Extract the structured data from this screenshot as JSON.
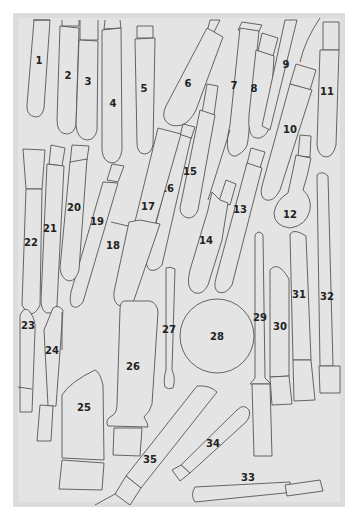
{
  "diagram": {
    "type": "numbered-shape-template",
    "colors": {
      "background": "#ffffff",
      "frame": "#dcdcdc",
      "panel": "#e4e4e4",
      "outline": "#555555",
      "label": "#222222"
    },
    "labels": {
      "1": "1",
      "2": "2",
      "3": "3",
      "4": "4",
      "5": "5",
      "6": "6",
      "7": "7",
      "8": "8",
      "9": "9",
      "10": "10",
      "11": "11",
      "12": "12",
      "13": "13",
      "14": "14",
      "15": "15",
      "16": "16",
      "17": "17",
      "18": "18",
      "19": "19",
      "20": "20",
      "21": "21",
      "22": "22",
      "23": "23",
      "24": "24",
      "25": "25",
      "26": "26",
      "27": "27",
      "28": "28",
      "29": "29",
      "30": "30",
      "31": "31",
      "32": "32",
      "33": "33",
      "34": "34",
      "35": "35"
    }
  }
}
